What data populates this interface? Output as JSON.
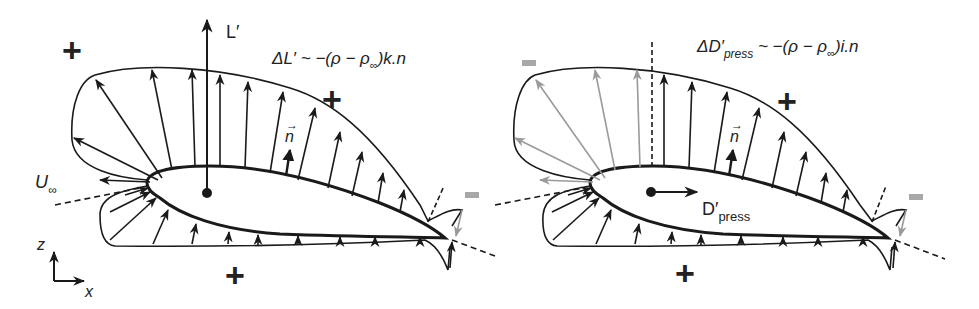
{
  "colors": {
    "ink": "#1a1a1a",
    "positive_arrow": "#1a1a1a",
    "negative_arrow": "#9a9a9a",
    "minus_sign": "#a8a8a8",
    "background": "#ffffff"
  },
  "left_panel": {
    "title": "Lift contribution",
    "formula": {
      "prefix": "ΔL′ ~ −(ρ − ρ",
      "inf_sub": "∞",
      "suffix": ")k.n",
      "vectors": [
        "k",
        "n"
      ]
    },
    "lift_label": "L′",
    "normal_label": "n",
    "freestream_label": "U",
    "freestream_sub": "∞",
    "axes": {
      "z_label": "z",
      "x_label": "x"
    },
    "signs": [
      {
        "symbol": "+",
        "region": "upper-left"
      },
      {
        "symbol": "+",
        "region": "above-upper-surface"
      },
      {
        "symbol": "+",
        "region": "below-lower-surface"
      },
      {
        "symbol": "−",
        "region": "trailing-edge"
      }
    ]
  },
  "right_panel": {
    "title": "Pressure drag contribution",
    "formula": {
      "prefix": "ΔD′",
      "press_sub": "press",
      "middle": " ~ −(ρ − ρ",
      "inf_sub": "∞",
      "suffix": ")i.n",
      "vectors": [
        "i",
        "n"
      ]
    },
    "drag_label": "D′",
    "drag_sub": "press",
    "normal_label": "n",
    "signs": [
      {
        "symbol": "−",
        "region": "upper-left-leading"
      },
      {
        "symbol": "+",
        "region": "above-upper-surface"
      },
      {
        "symbol": "+",
        "region": "below-lower-surface"
      },
      {
        "symbol": "−",
        "region": "trailing-edge"
      }
    ]
  }
}
